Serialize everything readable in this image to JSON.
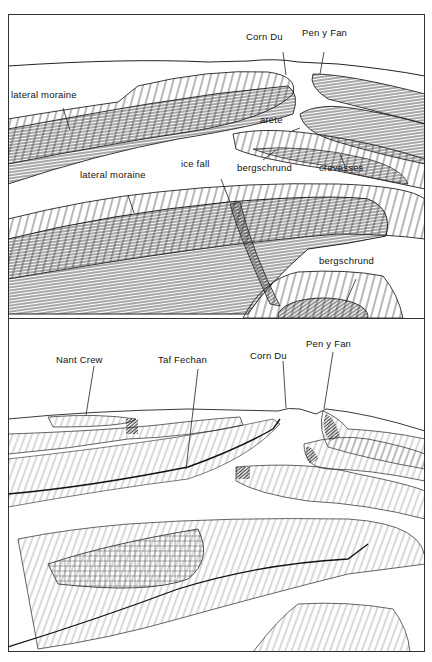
{
  "figure": {
    "panels": [
      {
        "id": "glacial",
        "labels": {
          "corn_du": "Corn Du",
          "pen_y_fan": "Pen y Fan",
          "lateral_moraine_1": "lateral moraine",
          "arete": "arete",
          "ice_fall": "ice fall",
          "bergschrund_1": "bergschrund",
          "crevasses": "crevasses",
          "lateral_moraine_2": "lateral moraine",
          "bergschrund_2": "bergschrund"
        }
      },
      {
        "id": "present",
        "labels": {
          "nant_crew": "Nant Crew",
          "taf_fechan": "Taf Fechan",
          "corn_du": "Corn Du",
          "pen_y_fan": "Pen y Fan"
        }
      }
    ]
  }
}
